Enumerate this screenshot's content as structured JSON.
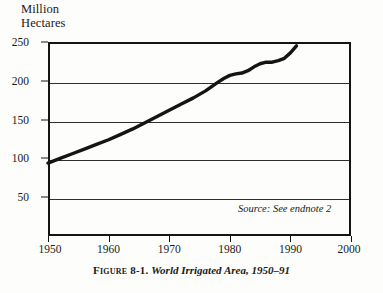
{
  "axis_title": "Million\nHectares",
  "source_note": "Source: See endnote 2",
  "caption": {
    "figure_label": "Figure 8-1.",
    "title": "World Irrigated Area, 1950–91"
  },
  "colors": {
    "line": "#141414",
    "grid": "#2e2e2e",
    "frame": "#141414",
    "background": "#fdfdfb"
  },
  "chart_data": {
    "type": "line",
    "title": "World Irrigated Area, 1950–91",
    "xlabel": "",
    "ylabel": "Million Hectares",
    "xlim": [
      1950,
      2000
    ],
    "ylim": [
      0,
      250
    ],
    "xticks": [
      1950,
      1960,
      1970,
      1980,
      1990,
      2000
    ],
    "yticks": [
      50,
      100,
      150,
      200,
      250
    ],
    "grid": true,
    "legend": false,
    "annotations": [
      "Source: See endnote 2"
    ],
    "series": [
      {
        "name": "World irrigated area",
        "x": [
          1950,
          1952,
          1954,
          1956,
          1958,
          1960,
          1962,
          1964,
          1966,
          1968,
          1970,
          1972,
          1974,
          1976,
          1978,
          1979,
          1980,
          1981,
          1982,
          1983,
          1984,
          1985,
          1986,
          1987,
          1988,
          1989,
          1990,
          1991
        ],
        "values": [
          94,
          100,
          106,
          112,
          118,
          124,
          131,
          138,
          146,
          154,
          162,
          170,
          178,
          187,
          198,
          203,
          207,
          209,
          210,
          213,
          218,
          222,
          224,
          224,
          226,
          229,
          236,
          245
        ]
      }
    ]
  }
}
